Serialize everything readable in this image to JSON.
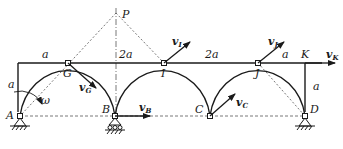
{
  "figure": {
    "type": "mechanism-velocity-diagram",
    "points": {
      "P": {
        "label": "P"
      },
      "A": {
        "label": "A"
      },
      "B": {
        "label": "B"
      },
      "C": {
        "label": "C"
      },
      "D": {
        "label": "D"
      },
      "G": {
        "label": "G"
      },
      "I": {
        "label": "I"
      },
      "J": {
        "label": "J"
      },
      "K": {
        "label": "K"
      }
    },
    "dimensions": {
      "top_left": "a",
      "top_mid_1": "2a",
      "top_mid_2": "2a",
      "top_right": "a",
      "left_height": "a",
      "right_height": "a"
    },
    "vectors": {
      "vG": {
        "main": "v",
        "sub": "G"
      },
      "vI": {
        "main": "v",
        "sub": "I"
      },
      "vJ": {
        "main": "v",
        "sub": "J"
      },
      "vB": {
        "main": "v",
        "sub": "B"
      },
      "vC": {
        "main": "v",
        "sub": "C"
      },
      "vK": {
        "main": "v",
        "sub": "K"
      }
    },
    "angular_velocity": {
      "label": "ω"
    },
    "colors": {
      "line": "#1a1a1a",
      "dashed": "#555555",
      "background": "#ffffff"
    }
  }
}
